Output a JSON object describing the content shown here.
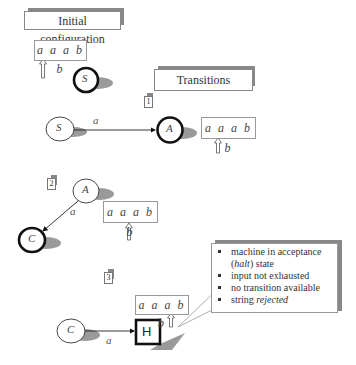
{
  "titles": {
    "initial": "Initial configuration",
    "transitions": "Transitions"
  },
  "steps": [
    {
      "label": "1"
    },
    {
      "label": "2"
    },
    {
      "label": "3"
    }
  ],
  "tapes": [
    {
      "content": "a a a b b",
      "head_index": 0
    },
    {
      "content": "a a a b b",
      "head_index": 1
    },
    {
      "content": "a a a b b",
      "head_index": 2
    },
    {
      "content": "a a a b b",
      "head_index": 4
    }
  ],
  "states": {
    "S": "S",
    "A": "A",
    "C": "C",
    "H": "H"
  },
  "edges": {
    "s_to_a": "a",
    "a_to_c": "a",
    "c_to_h": "a"
  },
  "callout": {
    "items": [
      {
        "text": "machine in acceptance ",
        "em": "halt",
        "after": ") state",
        "prefix_paren": true
      },
      {
        "text": "input not exhausted"
      },
      {
        "text": "no transition available"
      },
      {
        "text": "string ",
        "em": "rejected"
      }
    ],
    "item1_line1": "machine in acceptance",
    "item1_open": "(",
    "item1_em": "halt",
    "item1_close": ") state",
    "item2": "input not exhausted",
    "item3": "no transition available",
    "item4_text": "string ",
    "item4_em": "rejected"
  },
  "colors": {
    "shadow": "#888888",
    "stroke": "#111111",
    "border": "#999999"
  }
}
